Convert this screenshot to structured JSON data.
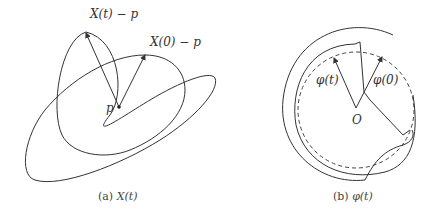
{
  "figure": {
    "panel_a": {
      "label_X_t": "X(t) − p",
      "label_X_0": "X(0) − p",
      "label_p": "p",
      "caption_prefix": "(a)",
      "caption_var": "X(t)"
    },
    "panel_b": {
      "label_phi_t": "φ(t)",
      "label_phi_0": "φ(0)",
      "label_O": "O",
      "caption_prefix": "(b)",
      "caption_var": "φ(t)"
    }
  }
}
